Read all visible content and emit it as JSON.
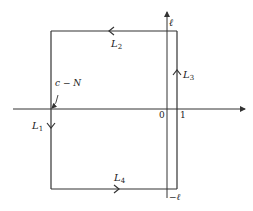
{
  "diagram": {
    "colors": {
      "line": "#333333",
      "text": "#222222",
      "background": "#ffffff"
    },
    "axes": {
      "real_axis": {
        "from": [
          13,
          109
        ],
        "to": [
          245,
          109
        ],
        "arrow": true
      },
      "imag_axis": {
        "from": [
          167,
          198
        ],
        "to": [
          167,
          12
        ],
        "arrow": true
      }
    },
    "contour": {
      "left_x": 51,
      "right_x": 177,
      "top_y": 31,
      "bottom_y": 189
    },
    "labels": {
      "ell": "ℓ",
      "neg_ell": "−ℓ",
      "zero": "0",
      "one": "1",
      "c_minus_N": "c − N",
      "L1": "L",
      "L1_sub": "1",
      "L2": "L",
      "L2_sub": "2",
      "L3": "L",
      "L3_sub": "3",
      "L4": "L",
      "L4_sub": "4"
    }
  }
}
